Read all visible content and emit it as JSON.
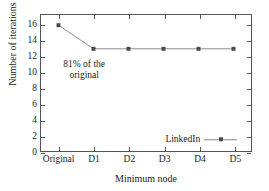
{
  "chart_data": {
    "type": "line",
    "title": "",
    "xlabel": "Minimum node",
    "ylabel": "Number of iterations",
    "categories": [
      "Original",
      "D1",
      "D2",
      "D3",
      "D4",
      "D5"
    ],
    "series": [
      {
        "name": "LinkedIn",
        "values": [
          16,
          13,
          13,
          13,
          13,
          13
        ],
        "line_color": "#8a8a8a",
        "marker_color": "#4a4a4a",
        "marker": "square"
      }
    ],
    "yticks": [
      0,
      2,
      4,
      6,
      8,
      10,
      12,
      14,
      16
    ],
    "ytick_labels": [
      "0",
      "2",
      "4",
      "6",
      "8",
      "10",
      "12",
      "14",
      "16"
    ],
    "ylim": [
      0,
      17.3
    ],
    "grid": false,
    "annotations": [
      {
        "lines": [
          "81% of the",
          "original"
        ],
        "x_value": 0.75,
        "y_value": 11.6
      }
    ],
    "legend": {
      "position": "inside-bottom-right",
      "entries": [
        "LinkedIn"
      ]
    }
  },
  "figure": {
    "frame_color": "#555555",
    "background": "#ffffff",
    "text_color": "#1a1a1a"
  }
}
